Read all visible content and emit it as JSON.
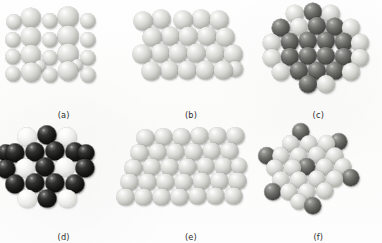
{
  "figure": {
    "background_color": "#fdfdfc",
    "panel_count": 6
  },
  "colors": {
    "light_sphere": "#d6d6d2",
    "white_sphere": "#ececea",
    "dark_sphere": "#4d4d4a",
    "black_sphere": "#161615",
    "caption_text": "#2b2b2b"
  },
  "panels": [
    {
      "id": "a",
      "caption": "(a)",
      "description": "square-like array of light gray spheres of two alternating sizes",
      "sphere_count": 22,
      "spheres": [
        {
          "cx": 14,
          "cy": 22,
          "r": 7.6,
          "tone": "light"
        },
        {
          "cx": 31,
          "cy": 18,
          "r": 10.2,
          "tone": "light"
        },
        {
          "cx": 50,
          "cy": 21,
          "r": 7.6,
          "tone": "light"
        },
        {
          "cx": 68,
          "cy": 17,
          "r": 10.4,
          "tone": "light"
        },
        {
          "cx": 88,
          "cy": 21,
          "r": 7.6,
          "tone": "light"
        },
        {
          "cx": 13,
          "cy": 40,
          "r": 7.6,
          "tone": "light"
        },
        {
          "cx": 31,
          "cy": 37,
          "r": 10.2,
          "tone": "light"
        },
        {
          "cx": 50,
          "cy": 40,
          "r": 7.6,
          "tone": "light"
        },
        {
          "cx": 68,
          "cy": 36,
          "r": 10.4,
          "tone": "light"
        },
        {
          "cx": 88,
          "cy": 40,
          "r": 7.6,
          "tone": "light"
        },
        {
          "cx": 13,
          "cy": 57,
          "r": 7.6,
          "tone": "light"
        },
        {
          "cx": 31,
          "cy": 55,
          "r": 10.2,
          "tone": "light"
        },
        {
          "cx": 50,
          "cy": 58,
          "r": 7.6,
          "tone": "light"
        },
        {
          "cx": 68,
          "cy": 54,
          "r": 10.4,
          "tone": "light"
        },
        {
          "cx": 88,
          "cy": 58,
          "r": 7.6,
          "tone": "light"
        },
        {
          "cx": 13,
          "cy": 74,
          "r": 7.4,
          "tone": "light"
        },
        {
          "cx": 31,
          "cy": 72,
          "r": 9.8,
          "tone": "light"
        },
        {
          "cx": 50,
          "cy": 75,
          "r": 7.4,
          "tone": "light"
        },
        {
          "cx": 68,
          "cy": 71,
          "r": 10.0,
          "tone": "light"
        },
        {
          "cx": 88,
          "cy": 75,
          "r": 7.4,
          "tone": "light"
        },
        {
          "cx": 40,
          "cy": 66,
          "r": 6.0,
          "tone": "light"
        },
        {
          "cx": 77,
          "cy": 65,
          "r": 6.0,
          "tone": "light"
        }
      ]
    },
    {
      "id": "b",
      "caption": "(b)",
      "description": "close-packed array of equal light gray spheres, four rows",
      "sphere_count": 22,
      "spheres": [
        {
          "cx": 16,
          "cy": 21,
          "r": 9.4,
          "tone": "light"
        },
        {
          "cx": 34,
          "cy": 19,
          "r": 9.4,
          "tone": "light"
        },
        {
          "cx": 56,
          "cy": 20,
          "r": 9.4,
          "tone": "light"
        },
        {
          "cx": 74,
          "cy": 19,
          "r": 9.4,
          "tone": "light"
        },
        {
          "cx": 92,
          "cy": 20,
          "r": 9.4,
          "tone": "light"
        },
        {
          "cx": 25,
          "cy": 37,
          "r": 9.4,
          "tone": "light"
        },
        {
          "cx": 43,
          "cy": 36,
          "r": 9.4,
          "tone": "light"
        },
        {
          "cx": 61,
          "cy": 36,
          "r": 9.4,
          "tone": "light"
        },
        {
          "cx": 80,
          "cy": 36,
          "r": 9.4,
          "tone": "light"
        },
        {
          "cx": 98,
          "cy": 37,
          "r": 9.4,
          "tone": "light"
        },
        {
          "cx": 15,
          "cy": 54,
          "r": 9.4,
          "tone": "light"
        },
        {
          "cx": 33,
          "cy": 53,
          "r": 9.4,
          "tone": "light"
        },
        {
          "cx": 51,
          "cy": 53,
          "r": 9.4,
          "tone": "light"
        },
        {
          "cx": 69,
          "cy": 53,
          "r": 9.4,
          "tone": "light"
        },
        {
          "cx": 88,
          "cy": 53,
          "r": 9.4,
          "tone": "light"
        },
        {
          "cx": 106,
          "cy": 54,
          "r": 9.4,
          "tone": "light"
        },
        {
          "cx": 24,
          "cy": 71,
          "r": 9.4,
          "tone": "light"
        },
        {
          "cx": 42,
          "cy": 70,
          "r": 9.4,
          "tone": "light"
        },
        {
          "cx": 60,
          "cy": 70,
          "r": 9.4,
          "tone": "light"
        },
        {
          "cx": 78,
          "cy": 70,
          "r": 9.4,
          "tone": "light"
        },
        {
          "cx": 96,
          "cy": 70,
          "r": 9.4,
          "tone": "light"
        },
        {
          "cx": 108,
          "cy": 69,
          "r": 8.0,
          "tone": "light"
        }
      ]
    },
    {
      "id": "c",
      "caption": "(c)",
      "description": "hexagonal cluster, dark gray spheres in the interior with a light gray outer ring",
      "sphere_count": 25,
      "spheres": [
        {
          "cx": 40,
          "cy": 14,
          "r": 9.2,
          "tone": "light"
        },
        {
          "cx": 58,
          "cy": 12,
          "r": 9.2,
          "tone": "dark"
        },
        {
          "cx": 76,
          "cy": 14,
          "r": 9.2,
          "tone": "light"
        },
        {
          "cx": 26,
          "cy": 28,
          "r": 9.2,
          "tone": "dark"
        },
        {
          "cx": 44,
          "cy": 27,
          "r": 9.2,
          "tone": "light"
        },
        {
          "cx": 62,
          "cy": 26,
          "r": 9.2,
          "tone": "dark"
        },
        {
          "cx": 80,
          "cy": 27,
          "r": 9.2,
          "tone": "dark"
        },
        {
          "cx": 96,
          "cy": 28,
          "r": 9.2,
          "tone": "light"
        },
        {
          "cx": 17,
          "cy": 43,
          "r": 9.2,
          "tone": "light"
        },
        {
          "cx": 35,
          "cy": 42,
          "r": 9.2,
          "tone": "dark"
        },
        {
          "cx": 53,
          "cy": 41,
          "r": 9.2,
          "tone": "dark"
        },
        {
          "cx": 71,
          "cy": 41,
          "r": 9.2,
          "tone": "dark"
        },
        {
          "cx": 89,
          "cy": 42,
          "r": 9.2,
          "tone": "dark"
        },
        {
          "cx": 105,
          "cy": 43,
          "r": 9.2,
          "tone": "light"
        },
        {
          "cx": 17,
          "cy": 58,
          "r": 9.2,
          "tone": "light"
        },
        {
          "cx": 35,
          "cy": 57,
          "r": 9.2,
          "tone": "dark"
        },
        {
          "cx": 53,
          "cy": 56,
          "r": 9.2,
          "tone": "dark"
        },
        {
          "cx": 71,
          "cy": 56,
          "r": 9.2,
          "tone": "dark"
        },
        {
          "cx": 89,
          "cy": 57,
          "r": 9.2,
          "tone": "dark"
        },
        {
          "cx": 105,
          "cy": 58,
          "r": 9.2,
          "tone": "light"
        },
        {
          "cx": 26,
          "cy": 72,
          "r": 9.2,
          "tone": "light"
        },
        {
          "cx": 44,
          "cy": 71,
          "r": 9.2,
          "tone": "dark"
        },
        {
          "cx": 62,
          "cy": 71,
          "r": 9.2,
          "tone": "dark"
        },
        {
          "cx": 80,
          "cy": 71,
          "r": 9.2,
          "tone": "dark"
        },
        {
          "cx": 96,
          "cy": 72,
          "r": 9.2,
          "tone": "light"
        },
        {
          "cx": 53,
          "cy": 84,
          "r": 9.0,
          "tone": "dark"
        },
        {
          "cx": 71,
          "cy": 84,
          "r": 9.0,
          "tone": "light"
        }
      ]
    },
    {
      "id": "d",
      "caption": "(d)",
      "description": "hexagonal cluster of black spheres interleaved with white spheres",
      "sphere_count": 21,
      "spheres": [
        {
          "cx": 27,
          "cy": 15,
          "r": 9.6,
          "tone": "white"
        },
        {
          "cx": 47,
          "cy": 13,
          "r": 9.6,
          "tone": "black"
        },
        {
          "cx": 67,
          "cy": 15,
          "r": 9.6,
          "tone": "white"
        },
        {
          "cx": 15,
          "cy": 31,
          "r": 9.6,
          "tone": "black"
        },
        {
          "cx": 35,
          "cy": 30,
          "r": 9.6,
          "tone": "black"
        },
        {
          "cx": 55,
          "cy": 29,
          "r": 9.6,
          "tone": "black"
        },
        {
          "cx": 75,
          "cy": 30,
          "r": 9.6,
          "tone": "black"
        },
        {
          "cx": 6,
          "cy": 47,
          "r": 9.6,
          "tone": "black"
        },
        {
          "cx": 25,
          "cy": 46,
          "r": 9.6,
          "tone": "white"
        },
        {
          "cx": 45,
          "cy": 45,
          "r": 9.6,
          "tone": "black"
        },
        {
          "cx": 65,
          "cy": 45,
          "r": 9.6,
          "tone": "white"
        },
        {
          "cx": 85,
          "cy": 46,
          "r": 9.6,
          "tone": "black"
        },
        {
          "cx": 15,
          "cy": 62,
          "r": 9.6,
          "tone": "black"
        },
        {
          "cx": 35,
          "cy": 61,
          "r": 9.6,
          "tone": "black"
        },
        {
          "cx": 55,
          "cy": 61,
          "r": 9.6,
          "tone": "black"
        },
        {
          "cx": 75,
          "cy": 62,
          "r": 9.6,
          "tone": "black"
        },
        {
          "cx": 27,
          "cy": 77,
          "r": 9.4,
          "tone": "white"
        },
        {
          "cx": 47,
          "cy": 77,
          "r": 9.4,
          "tone": "black"
        },
        {
          "cx": 67,
          "cy": 77,
          "r": 9.4,
          "tone": "white"
        },
        {
          "cx": 6,
          "cy": 31,
          "r": 8.6,
          "tone": "black"
        },
        {
          "cx": 86,
          "cy": 31,
          "r": 8.6,
          "tone": "black"
        }
      ]
    },
    {
      "id": "e",
      "caption": "(e)",
      "description": "large skewed parallelogram (rhombic) array of light gray spheres, five rows",
      "sphere_count": 33,
      "spheres": [
        {
          "cx": 18,
          "cy": 16,
          "r": 8.6,
          "tone": "light"
        },
        {
          "cx": 36,
          "cy": 15,
          "r": 8.6,
          "tone": "light"
        },
        {
          "cx": 54,
          "cy": 15,
          "r": 8.6,
          "tone": "light"
        },
        {
          "cx": 72,
          "cy": 14,
          "r": 8.6,
          "tone": "light"
        },
        {
          "cx": 90,
          "cy": 14,
          "r": 8.6,
          "tone": "light"
        },
        {
          "cx": 108,
          "cy": 14,
          "r": 8.6,
          "tone": "light"
        },
        {
          "cx": 12,
          "cy": 31,
          "r": 8.6,
          "tone": "light"
        },
        {
          "cx": 30,
          "cy": 30,
          "r": 8.6,
          "tone": "light"
        },
        {
          "cx": 48,
          "cy": 30,
          "r": 8.6,
          "tone": "light"
        },
        {
          "cx": 66,
          "cy": 30,
          "r": 8.6,
          "tone": "light"
        },
        {
          "cx": 84,
          "cy": 29,
          "r": 8.6,
          "tone": "light"
        },
        {
          "cx": 102,
          "cy": 29,
          "r": 8.6,
          "tone": "light"
        },
        {
          "cx": 6,
          "cy": 46,
          "r": 8.6,
          "tone": "light"
        },
        {
          "cx": 24,
          "cy": 45,
          "r": 8.6,
          "tone": "light"
        },
        {
          "cx": 42,
          "cy": 45,
          "r": 8.6,
          "tone": "light"
        },
        {
          "cx": 60,
          "cy": 45,
          "r": 8.6,
          "tone": "light"
        },
        {
          "cx": 78,
          "cy": 44,
          "r": 8.6,
          "tone": "light"
        },
        {
          "cx": 96,
          "cy": 44,
          "r": 8.6,
          "tone": "light"
        },
        {
          "cx": 2,
          "cy": 60,
          "r": 8.6,
          "tone": "light"
        },
        {
          "cx": 20,
          "cy": 60,
          "r": 8.6,
          "tone": "light"
        },
        {
          "cx": 38,
          "cy": 60,
          "r": 8.6,
          "tone": "light"
        },
        {
          "cx": 56,
          "cy": 60,
          "r": 8.6,
          "tone": "light"
        },
        {
          "cx": 74,
          "cy": 59,
          "r": 8.6,
          "tone": "light"
        },
        {
          "cx": 92,
          "cy": 59,
          "r": 8.6,
          "tone": "light"
        },
        {
          "cx": 110,
          "cy": 59,
          "r": 8.6,
          "tone": "light"
        },
        {
          "cx": -2,
          "cy": 75,
          "r": 8.6,
          "tone": "light"
        },
        {
          "cx": 16,
          "cy": 75,
          "r": 8.6,
          "tone": "light"
        },
        {
          "cx": 34,
          "cy": 75,
          "r": 8.6,
          "tone": "light"
        },
        {
          "cx": 52,
          "cy": 75,
          "r": 8.6,
          "tone": "light"
        },
        {
          "cx": 70,
          "cy": 74,
          "r": 8.6,
          "tone": "light"
        },
        {
          "cx": 88,
          "cy": 74,
          "r": 8.6,
          "tone": "light"
        },
        {
          "cx": 106,
          "cy": 74,
          "r": 8.6,
          "tone": "light"
        },
        {
          "cx": 112,
          "cy": 44,
          "r": 8.0,
          "tone": "light"
        }
      ]
    },
    {
      "id": "f",
      "caption": "(f)",
      "description": "light gray hexagonal cluster with six dark gray spheres at the outer points and one dark sphere at the centre",
      "sphere_count": 26,
      "spheres": [
        {
          "cx": 46,
          "cy": 10,
          "r": 8.8,
          "tone": "dark"
        },
        {
          "cx": 84,
          "cy": 20,
          "r": 8.8,
          "tone": "dark"
        },
        {
          "cx": 12,
          "cy": 34,
          "r": 8.8,
          "tone": "dark"
        },
        {
          "cx": 96,
          "cy": 56,
          "r": 8.8,
          "tone": "dark"
        },
        {
          "cx": 18,
          "cy": 70,
          "r": 8.8,
          "tone": "dark"
        },
        {
          "cx": 58,
          "cy": 84,
          "r": 8.8,
          "tone": "dark"
        },
        {
          "cx": 52,
          "cy": 45,
          "r": 8.8,
          "tone": "dark"
        },
        {
          "cx": 36,
          "cy": 22,
          "r": 8.8,
          "tone": "light"
        },
        {
          "cx": 54,
          "cy": 22,
          "r": 8.8,
          "tone": "light"
        },
        {
          "cx": 72,
          "cy": 22,
          "r": 8.8,
          "tone": "light"
        },
        {
          "cx": 26,
          "cy": 34,
          "r": 8.8,
          "tone": "light"
        },
        {
          "cx": 44,
          "cy": 34,
          "r": 8.8,
          "tone": "light"
        },
        {
          "cx": 62,
          "cy": 33,
          "r": 8.8,
          "tone": "light"
        },
        {
          "cx": 80,
          "cy": 34,
          "r": 8.8,
          "tone": "light"
        },
        {
          "cx": 20,
          "cy": 46,
          "r": 8.8,
          "tone": "light"
        },
        {
          "cx": 38,
          "cy": 46,
          "r": 8.8,
          "tone": "light"
        },
        {
          "cx": 70,
          "cy": 45,
          "r": 8.8,
          "tone": "light"
        },
        {
          "cx": 88,
          "cy": 45,
          "r": 8.8,
          "tone": "light"
        },
        {
          "cx": 26,
          "cy": 58,
          "r": 8.8,
          "tone": "light"
        },
        {
          "cx": 44,
          "cy": 58,
          "r": 8.8,
          "tone": "light"
        },
        {
          "cx": 62,
          "cy": 57,
          "r": 8.8,
          "tone": "light"
        },
        {
          "cx": 80,
          "cy": 57,
          "r": 8.8,
          "tone": "light"
        },
        {
          "cx": 34,
          "cy": 70,
          "r": 8.8,
          "tone": "light"
        },
        {
          "cx": 52,
          "cy": 70,
          "r": 8.8,
          "tone": "light"
        },
        {
          "cx": 70,
          "cy": 69,
          "r": 8.8,
          "tone": "light"
        },
        {
          "cx": 44,
          "cy": 80,
          "r": 8.4,
          "tone": "light"
        }
      ]
    }
  ]
}
